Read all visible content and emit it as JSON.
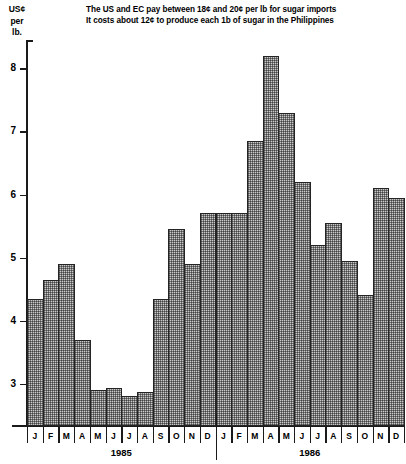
{
  "chart_data": {
    "type": "bar",
    "title": "The US and EC pay between 18¢ and 20¢ per lb for sugar imports",
    "subtitle": "It costs about 12¢ to produce each 1b of sugar in the Philippines",
    "ylabel_lines": [
      "US¢",
      "per",
      "lb."
    ],
    "ylabel": "US¢ per lb.",
    "xlabel": "",
    "ylim": [
      2.33,
      8.45
    ],
    "ytick_values": [
      3,
      4,
      5,
      6,
      7,
      8
    ],
    "ytick_labels": [
      "3",
      "4",
      "5",
      "6",
      "7",
      "8"
    ],
    "grid": false,
    "legend": null,
    "bar_color": "#c9c9c9",
    "bar_edge_color": "#242424",
    "axis_color": "#1a1a1a",
    "categories": [
      "J",
      "F",
      "M",
      "A",
      "M",
      "J",
      "J",
      "A",
      "S",
      "O",
      "N",
      "D",
      "J",
      "F",
      "M",
      "A",
      "M",
      "J",
      "J",
      "A",
      "S",
      "O",
      "N",
      "D"
    ],
    "values": [
      4.35,
      4.65,
      4.9,
      3.7,
      2.9,
      2.93,
      2.8,
      2.87,
      4.35,
      5.45,
      4.9,
      5.7,
      5.7,
      5.7,
      6.85,
      8.2,
      7.3,
      6.2,
      5.2,
      5.55,
      4.95,
      4.4,
      6.1,
      5.95
    ],
    "group_labels": [
      "1985",
      "1986"
    ],
    "groups": [
      {
        "label": "1985",
        "start_index": 0,
        "end_index": 11
      },
      {
        "label": "1986",
        "start_index": 12,
        "end_index": 23
      }
    ]
  }
}
